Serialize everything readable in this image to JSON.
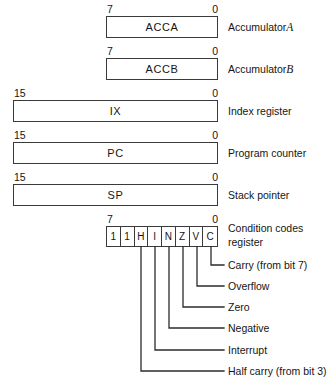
{
  "registers": [
    {
      "name": "ACCA",
      "msb": "7",
      "lsb": "0",
      "description": "Accumulator",
      "description_suffix": "A",
      "width_bits": 8
    },
    {
      "name": "ACCB",
      "msb": "7",
      "lsb": "0",
      "description": "Accumulator",
      "description_suffix": "B",
      "width_bits": 8
    },
    {
      "name": "IX",
      "msb": "15",
      "lsb": "0",
      "description": "Index register",
      "description_suffix": "",
      "width_bits": 16
    },
    {
      "name": "PC",
      "msb": "15",
      "lsb": "0",
      "description": "Program counter",
      "description_suffix": "",
      "width_bits": 16
    },
    {
      "name": "SP",
      "msb": "15",
      "lsb": "0",
      "description": "Stack pointer",
      "description_suffix": "",
      "width_bits": 16
    }
  ],
  "condition_codes": {
    "msb": "7",
    "lsb": "0",
    "description_line1": "Condition codes",
    "description_line2": "register",
    "bits": [
      {
        "position": "7",
        "symbol": "1"
      },
      {
        "position": "6",
        "symbol": "1"
      },
      {
        "position": "5",
        "symbol": "H"
      },
      {
        "position": "4",
        "symbol": "I"
      },
      {
        "position": "3",
        "symbol": "N"
      },
      {
        "position": "2",
        "symbol": "Z"
      },
      {
        "position": "1",
        "symbol": "V"
      },
      {
        "position": "0",
        "symbol": "C"
      }
    ],
    "flags": [
      {
        "symbol": "C",
        "label": "Carry (from bit 7)"
      },
      {
        "symbol": "V",
        "label": "Overflow"
      },
      {
        "symbol": "Z",
        "label": "Zero"
      },
      {
        "symbol": "N",
        "label": "Negative"
      },
      {
        "symbol": "I",
        "label": "Interrupt"
      },
      {
        "symbol": "H",
        "label": "Half carry (from bit 3)"
      }
    ]
  },
  "colors": {
    "ink": "#1a1a1a",
    "rule": "#3a3a3a",
    "background": "#ffffff"
  }
}
